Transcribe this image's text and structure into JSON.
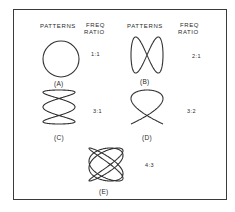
{
  "headers": {
    "col1_patterns": "PATTERNS",
    "col1_freq_line1": "FREQ",
    "col1_freq_line2": "RATIO",
    "col2_patterns": "PATTERNS",
    "col2_freq_line1": "FREQ",
    "col2_freq_line2": "RATIO"
  },
  "patterns": [
    {
      "label": "(A)",
      "ratio": "1:1",
      "shape": "circle-icon"
    },
    {
      "label": "(B)",
      "ratio": "2:1",
      "shape": "lissajous-2-1"
    },
    {
      "label": "(C)",
      "ratio": "3:1",
      "shape": "lissajous-3-1"
    },
    {
      "label": "(D)",
      "ratio": "3:2",
      "shape": "lissajous-3-2"
    },
    {
      "label": "(E)",
      "ratio": "4:3",
      "shape": "lissajous-4-3"
    }
  ],
  "colors": {
    "line": "#333333",
    "frame": "#3a3a3a",
    "background": "#ffffff"
  }
}
